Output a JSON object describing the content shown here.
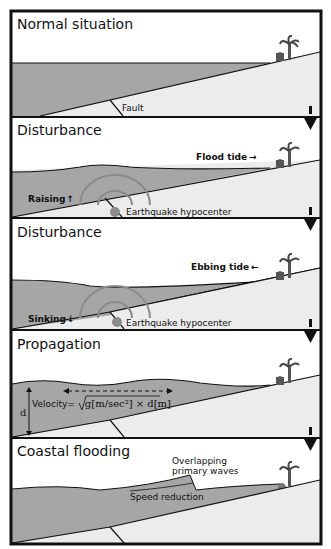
{
  "figure": {
    "colors": {
      "water": "#a6a6a6",
      "land": "#ececec",
      "sky": "#ffffff",
      "hypocenter": "#8c8c8c",
      "wave_rings": "#8a8a8a",
      "border": "#111111"
    },
    "panels": [
      {
        "title": "Normal situation",
        "labels": {
          "fault": "Fault"
        }
      },
      {
        "title": "Disturbance",
        "labels": {
          "tide": "Flood tide",
          "tide_arrow": "→",
          "motion": "Raising",
          "motion_arrow": "↑",
          "hypocenter": "Earthquake hypocenter"
        }
      },
      {
        "title": "Disturbance",
        "labels": {
          "tide": "Ebbing tide",
          "tide_arrow": "←",
          "motion": "Sinking",
          "motion_arrow": "↓",
          "hypocenter": "Earthquake hypocenter"
        }
      },
      {
        "title": "Propagation",
        "labels": {
          "depth": "d",
          "velocity_prefix": "Velocity=",
          "velocity_formula": "g[m/sec²] × d[m]"
        }
      },
      {
        "title": "Coastal flooding",
        "labels": {
          "overlap_line1": "Overlapping",
          "overlap_line2": "primary waves",
          "speed": "Speed reduction"
        }
      }
    ]
  }
}
